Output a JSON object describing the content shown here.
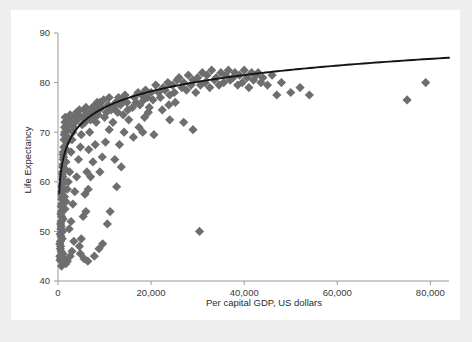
{
  "chart_data": {
    "type": "scatter",
    "title": "",
    "xlabel": "Per capital GDP, US dollars",
    "ylabel": "Life Expectancy",
    "xlim": [
      0,
      84000
    ],
    "ylim": [
      40,
      90
    ],
    "xticks": [
      0,
      20000,
      40000,
      60000,
      80000
    ],
    "xtick_labels": [
      "0",
      "20,000",
      "40,000",
      "60,000",
      "80,000"
    ],
    "yticks": [
      40,
      50,
      60,
      70,
      80,
      90
    ],
    "ytick_labels": [
      "40",
      "50",
      "60",
      "70",
      "80",
      "90"
    ],
    "grid": false,
    "legend": null,
    "marker": {
      "shape": "diamond",
      "color": "#6e6e6e",
      "size": 7
    },
    "series": [
      {
        "name": "Countries",
        "points": [
          [
            400,
            45.0
          ],
          [
            450,
            44.2
          ],
          [
            500,
            46.5
          ],
          [
            520,
            48.0
          ],
          [
            560,
            47.0
          ],
          [
            600,
            50.5
          ],
          [
            640,
            49.0
          ],
          [
            680,
            52.0
          ],
          [
            700,
            51.0
          ],
          [
            720,
            54.0
          ],
          [
            760,
            53.0
          ],
          [
            800,
            55.5
          ],
          [
            820,
            56.5
          ],
          [
            860,
            58.0
          ],
          [
            900,
            57.0
          ],
          [
            940,
            59.5
          ],
          [
            980,
            60.5
          ],
          [
            1000,
            62.0
          ],
          [
            1040,
            61.0
          ],
          [
            1080,
            63.5
          ],
          [
            1120,
            64.5
          ],
          [
            1160,
            66.0
          ],
          [
            1200,
            65.0
          ],
          [
            1250,
            67.0
          ],
          [
            1300,
            68.5
          ],
          [
            1350,
            69.5
          ],
          [
            1400,
            71.0
          ],
          [
            1450,
            70.0
          ],
          [
            1500,
            72.0
          ],
          [
            1550,
            73.0
          ],
          [
            400,
            47.5
          ],
          [
            480,
            49.5
          ],
          [
            560,
            51.5
          ],
          [
            620,
            53.5
          ],
          [
            700,
            55.0
          ],
          [
            780,
            57.5
          ],
          [
            840,
            59.0
          ],
          [
            920,
            61.5
          ],
          [
            1000,
            63.0
          ],
          [
            1100,
            65.5
          ],
          [
            600,
            44.5
          ],
          [
            650,
            46.0
          ],
          [
            900,
            48.5
          ],
          [
            950,
            50.0
          ],
          [
            1100,
            52.5
          ],
          [
            1400,
            57.0
          ],
          [
            1600,
            62.5
          ],
          [
            1700,
            64.0
          ],
          [
            1800,
            66.5
          ],
          [
            1900,
            68.0
          ],
          [
            2000,
            70.5
          ],
          [
            2100,
            69.0
          ],
          [
            2200,
            71.5
          ],
          [
            2400,
            72.5
          ],
          [
            2600,
            73.5
          ],
          [
            1500,
            54.5
          ],
          [
            1700,
            56.0
          ],
          [
            2000,
            58.5
          ],
          [
            2200,
            60.0
          ],
          [
            2500,
            62.0
          ],
          [
            2800,
            66.0
          ],
          [
            3000,
            68.5
          ],
          [
            3200,
            70.0
          ],
          [
            3400,
            71.0
          ],
          [
            3600,
            72.0
          ],
          [
            3800,
            73.0
          ],
          [
            4000,
            74.0
          ],
          [
            4200,
            72.5
          ],
          [
            4400,
            73.5
          ],
          [
            4600,
            74.5
          ],
          [
            2400,
            50.5
          ],
          [
            2800,
            52.0
          ],
          [
            3200,
            55.5
          ],
          [
            3600,
            58.0
          ],
          [
            4000,
            61.0
          ],
          [
            4400,
            64.5
          ],
          [
            4800,
            67.0
          ],
          [
            5000,
            69.5
          ],
          [
            5200,
            71.5
          ],
          [
            5400,
            73.0
          ],
          [
            5600,
            74.5
          ],
          [
            5800,
            72.0
          ],
          [
            6000,
            75.0
          ],
          [
            6200,
            73.5
          ],
          [
            6400,
            74.0
          ],
          [
            4600,
            47.0
          ],
          [
            5000,
            48.5
          ],
          [
            5400,
            53.0
          ],
          [
            5800,
            57.5
          ],
          [
            6200,
            62.0
          ],
          [
            6600,
            66.5
          ],
          [
            6800,
            70.0
          ],
          [
            7000,
            72.5
          ],
          [
            7200,
            74.0
          ],
          [
            7400,
            75.0
          ],
          [
            7600,
            73.0
          ],
          [
            7800,
            74.5
          ],
          [
            8000,
            75.5
          ],
          [
            8200,
            72.0
          ],
          [
            8400,
            76.0
          ],
          [
            6000,
            54.0
          ],
          [
            6500,
            58.5
          ],
          [
            7000,
            61.0
          ],
          [
            7500,
            64.0
          ],
          [
            8000,
            67.5
          ],
          [
            8600,
            73.5
          ],
          [
            8800,
            74.5
          ],
          [
            9000,
            76.0
          ],
          [
            9400,
            75.0
          ],
          [
            9800,
            76.5
          ],
          [
            10000,
            73.0
          ],
          [
            10400,
            74.0
          ],
          [
            10800,
            75.5
          ],
          [
            11000,
            77.0
          ],
          [
            11400,
            74.5
          ],
          [
            9000,
            62.0
          ],
          [
            9500,
            65.0
          ],
          [
            10200,
            68.0
          ],
          [
            11000,
            70.5
          ],
          [
            11800,
            72.0
          ],
          [
            12000,
            75.0
          ],
          [
            12400,
            76.0
          ],
          [
            12800,
            74.0
          ],
          [
            13000,
            77.0
          ],
          [
            13400,
            75.5
          ],
          [
            13800,
            76.5
          ],
          [
            14000,
            73.5
          ],
          [
            14400,
            77.5
          ],
          [
            14800,
            76.0
          ],
          [
            15000,
            74.5
          ],
          [
            12200,
            64.5
          ],
          [
            13200,
            67.5
          ],
          [
            14200,
            70.0
          ],
          [
            15200,
            72.5
          ],
          [
            16000,
            75.0
          ],
          [
            16400,
            77.0
          ],
          [
            16800,
            76.0
          ],
          [
            17200,
            78.0
          ],
          [
            17600,
            75.5
          ],
          [
            18000,
            77.5
          ],
          [
            18400,
            76.5
          ],
          [
            18800,
            78.5
          ],
          [
            19200,
            77.0
          ],
          [
            19600,
            75.0
          ],
          [
            20000,
            78.0
          ],
          [
            16200,
            69.0
          ],
          [
            17400,
            71.0
          ],
          [
            18600,
            73.0
          ],
          [
            19400,
            74.0
          ],
          [
            20400,
            76.5
          ],
          [
            21000,
            79.5
          ],
          [
            21600,
            78.0
          ],
          [
            22000,
            77.0
          ],
          [
            22600,
            79.0
          ],
          [
            23000,
            78.5
          ],
          [
            23600,
            80.0
          ],
          [
            24000,
            77.5
          ],
          [
            24600,
            79.5
          ],
          [
            25000,
            78.0
          ],
          [
            25600,
            80.5
          ],
          [
            22400,
            74.5
          ],
          [
            23800,
            75.5
          ],
          [
            25200,
            76.0
          ],
          [
            26000,
            81.0
          ],
          [
            26600,
            79.0
          ],
          [
            27000,
            80.0
          ],
          [
            27600,
            78.5
          ],
          [
            28000,
            81.5
          ],
          [
            28600,
            79.5
          ],
          [
            29000,
            80.5
          ],
          [
            29600,
            78.0
          ],
          [
            30000,
            81.0
          ],
          [
            30600,
            79.5
          ],
          [
            31000,
            82.0
          ],
          [
            31600,
            80.0
          ],
          [
            32000,
            81.5
          ],
          [
            32600,
            79.0
          ],
          [
            33000,
            82.5
          ],
          [
            33600,
            80.5
          ],
          [
            34000,
            81.0
          ],
          [
            34600,
            79.5
          ],
          [
            35000,
            82.0
          ],
          [
            35600,
            80.0
          ],
          [
            36000,
            81.5
          ],
          [
            36600,
            82.5
          ],
          [
            37000,
            80.5
          ],
          [
            37600,
            81.0
          ],
          [
            38000,
            82.0
          ],
          [
            38600,
            79.5
          ],
          [
            39000,
            81.5
          ],
          [
            39600,
            80.0
          ],
          [
            40000,
            82.5
          ],
          [
            40600,
            81.0
          ],
          [
            41000,
            79.0
          ],
          [
            41600,
            82.0
          ],
          [
            42000,
            80.5
          ],
          [
            42600,
            81.5
          ],
          [
            43000,
            82.0
          ],
          [
            43600,
            80.0
          ],
          [
            44000,
            81.0
          ],
          [
            45000,
            79.5
          ],
          [
            46000,
            81.5
          ],
          [
            47000,
            77.5
          ],
          [
            48000,
            80.0
          ],
          [
            50000,
            78.0
          ],
          [
            52000,
            79.0
          ],
          [
            54000,
            77.5
          ],
          [
            30400,
            50.0
          ],
          [
            75000,
            76.5
          ],
          [
            79000,
            80.0
          ],
          [
            27000,
            72.0
          ],
          [
            29000,
            70.5
          ],
          [
            24000,
            72.5
          ],
          [
            20600,
            69.5
          ],
          [
            18200,
            70.0
          ],
          [
            13600,
            63.0
          ],
          [
            12600,
            59.0
          ],
          [
            11200,
            54.0
          ],
          [
            10600,
            51.5
          ],
          [
            9600,
            47.5
          ],
          [
            8800,
            46.5
          ],
          [
            7800,
            45.0
          ],
          [
            6400,
            44.0
          ],
          [
            5600,
            44.5
          ],
          [
            4800,
            45.5
          ],
          [
            3400,
            48.0
          ],
          [
            3000,
            46.0
          ],
          [
            2600,
            45.0
          ],
          [
            2000,
            44.0
          ],
          [
            1700,
            43.5
          ],
          [
            1300,
            44.5
          ],
          [
            1050,
            45.5
          ],
          [
            880,
            44.0
          ],
          [
            760,
            43.0
          ],
          [
            640,
            45.0
          ]
        ]
      }
    ],
    "trend": {
      "type": "logarithmic",
      "equation_form": "y = a + b*ln(x)",
      "a": 31.5,
      "b": 4.72,
      "color": "#151515",
      "x_start": 260,
      "x_end": 84000
    }
  }
}
